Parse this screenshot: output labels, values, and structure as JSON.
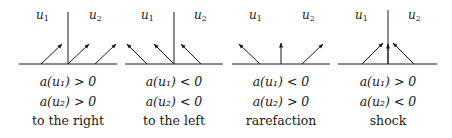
{
  "panels": [
    {
      "id": "to-the-right",
      "label_left": "u",
      "label_left_sub": "1",
      "label_right": "u",
      "label_right_sub": "2",
      "cond1": "a(u₁) > 0",
      "cond2": "a(u₂) > 0",
      "caption": "to the right",
      "has_vertical": true,
      "arrows_direction": "right"
    },
    {
      "id": "to-the-left",
      "label_left": "u",
      "label_left_sub": "1",
      "label_right": "u",
      "label_right_sub": "2",
      "cond1": "a(u₁) < 0",
      "cond2": "a(u₂) < 0",
      "caption": "to the left",
      "has_vertical": true,
      "arrows_direction": "left"
    },
    {
      "id": "rarefaction",
      "label_left": "u",
      "label_left_sub": "1",
      "label_right": "u",
      "label_right_sub": "2",
      "cond1": "a(u₁) < 0",
      "cond2": "a(u₂) > 0",
      "caption": "rarefaction",
      "has_vertical": false,
      "arrows_direction": "fan-out"
    },
    {
      "id": "shock",
      "label_left": "u",
      "label_left_sub": "1",
      "label_right": "u",
      "label_right_sub": "2",
      "cond1": "a(u₁) > 0",
      "cond2": "a(u₂) < 0",
      "caption": "shock",
      "has_vertical": true,
      "arrows_direction": "converge"
    }
  ],
  "colors": {
    "stroke": "#1a1a1a",
    "background": "#ffffff"
  }
}
